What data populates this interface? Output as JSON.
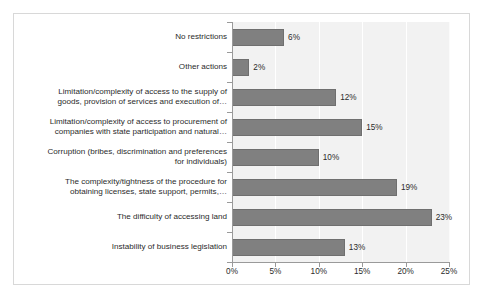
{
  "chart_data": {
    "type": "bar",
    "orientation": "horizontal",
    "title": "",
    "subtitle": "",
    "xlabel": "",
    "ylabel": "",
    "xlim": [
      0,
      25
    ],
    "xticks": [
      0,
      5,
      10,
      15,
      20,
      25
    ],
    "xtick_labels": [
      "0%",
      "5%",
      "10%",
      "15%",
      "20%",
      "25%"
    ],
    "grid": "vertical",
    "legend": "none",
    "value_suffix": "%",
    "categories": [
      "No restrictions",
      "Other actions",
      "Limitation/complexity of access to the supply of\ngoods, provision of services and execution of…",
      "Limitation/complexity of access to procurement of\ncompanies with state participation and natural…",
      "Corruption (bribes, discrimination and preferences\nfor individuals)",
      "The complexity/tightness of the procedure for\nobtaining licenses, state support, permits,…",
      "The difficulty of accessing land",
      "Instability of business legislation"
    ],
    "values": [
      6,
      2,
      12,
      15,
      10,
      19,
      23,
      13
    ],
    "value_labels": [
      "6%",
      "2%",
      "12%",
      "15%",
      "10%",
      "19%",
      "23%",
      "13%"
    ],
    "colors": {
      "bar_fill": "#808080",
      "bar_border": "#6f6f6f",
      "plot_background": "#f2f2f2",
      "gridline": "#ffffff",
      "axis_line": "#9a9a9a",
      "frame_border": "#d8d8d8",
      "text": "#2b2b2b",
      "page_background": "#ffffff"
    }
  }
}
